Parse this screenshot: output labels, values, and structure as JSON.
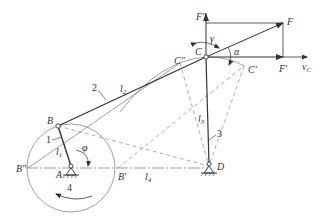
{
  "diagram": {
    "type": "four-bar linkage (crank-rocker) with force analysis",
    "points": {
      "A": {
        "label": "A",
        "x": 71,
        "y": 168
      },
      "B": {
        "label": "B",
        "x": 58,
        "y": 126
      },
      "B_dd": {
        "label": "B″",
        "x": 28,
        "y": 168
      },
      "B_d": {
        "label": "B′",
        "x": 118,
        "y": 168
      },
      "C": {
        "label": "C",
        "x": 206,
        "y": 57
      },
      "C_dd": {
        "label": "C″",
        "x": 180,
        "y": 63
      },
      "C_d": {
        "label": "C′",
        "x": 244,
        "y": 66
      },
      "D": {
        "label": "D",
        "x": 209,
        "y": 166
      },
      "F": {
        "label": "F",
        "x": 283,
        "y": 23
      },
      "F_dd": {
        "label": "F″",
        "x": 206,
        "y": 23
      },
      "F_d": {
        "label": "F′",
        "x": 283,
        "y": 57
      }
    },
    "links": [
      {
        "id": "1",
        "label": "1",
        "length_label": "l",
        "length_sub": "1"
      },
      {
        "id": "2",
        "label": "2",
        "length_label": "l",
        "length_sub": "2"
      },
      {
        "id": "3",
        "label": "3",
        "length_label": "l",
        "length_sub": "3"
      },
      {
        "id": "4",
        "label": "4",
        "length_label": "l",
        "length_sub": "4"
      }
    ],
    "angles": {
      "phi": "φ",
      "gamma": "γ",
      "alpha": "α"
    },
    "velocity": {
      "label": "v",
      "sub": "C"
    },
    "colors": {
      "line": "#333333",
      "dashed": "#8a8a8a",
      "thin": "#777777"
    }
  }
}
